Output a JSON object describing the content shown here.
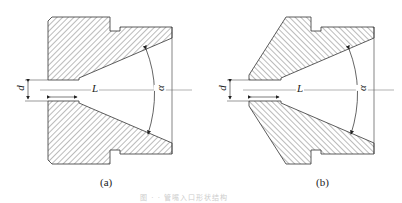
{
  "figure": {
    "caption": "图 · · 管嘴入口形状结构",
    "colors": {
      "line": "#333333",
      "hatch": "#555555",
      "background": "#ffffff"
    },
    "subfigures": [
      {
        "id": "a",
        "label": "(a)",
        "dim_d": "d",
        "dim_L": "L",
        "angle": "α"
      },
      {
        "id": "b",
        "label": "(b)",
        "dim_d": "d",
        "dim_L": "L",
        "angle": "α"
      }
    ]
  }
}
